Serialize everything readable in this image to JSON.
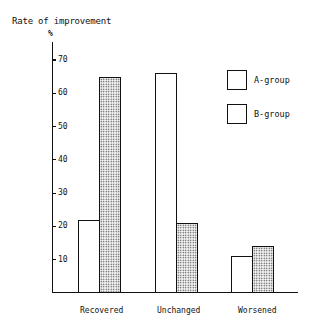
{
  "chart_data": {
    "type": "bar",
    "title": "Rate of improvement",
    "ylabel": "%",
    "xlabel": "",
    "categories": [
      "Recovered",
      "Unchanged",
      "Worsened"
    ],
    "series": [
      {
        "name": "A-group",
        "values": [
          22,
          66,
          11
        ],
        "fill": "white"
      },
      {
        "name": "B-group",
        "values": [
          65,
          21,
          14
        ],
        "fill": "dotted"
      }
    ],
    "yticks": [
      10,
      20,
      30,
      40,
      50,
      60,
      70
    ],
    "ylim": [
      0,
      75
    ],
    "grid": false,
    "legend_position": "upper right"
  },
  "labels": {
    "title": "Rate of improvement",
    "unit": "%",
    "yticks": [
      "10",
      "20",
      "30",
      "40",
      "50",
      "60",
      "70"
    ],
    "categories": [
      "Recovered",
      "Unchanged",
      "Worsened"
    ],
    "legend": [
      "A-group",
      "B-group"
    ]
  }
}
